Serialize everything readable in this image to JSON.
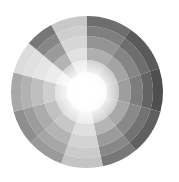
{
  "background_color": "#ffffff",
  "figure": {
    "title": "",
    "width": 179,
    "height": 182
  },
  "chart_data": {
    "type": "pie",
    "subtype": "polar-area-sunburst",
    "title": "",
    "subtitle": "",
    "xlabel": "",
    "ylabel": "",
    "grid": false,
    "axes_visible": false,
    "tick_labels_visible": false,
    "legend": false,
    "legend_position": "none",
    "background_color": "#ffffff",
    "center": {
      "x": 87,
      "y": 92
    },
    "outer_radius": 76,
    "inner_white_radius": 9,
    "ring_count": 6,
    "ring_radii": [
      9,
      20,
      32,
      44,
      56,
      66,
      76
    ],
    "ring_shading_note": "rings lighten progressively toward the center; innermost core is near-white",
    "ring_lightness_factors": [
      0.92,
      0.68,
      0.45,
      0.26,
      0.12,
      0.0
    ],
    "sector_count": 12,
    "angle_unit": "degrees-clockwise-from-12-oclock",
    "categories": [
      "S1",
      "S2",
      "S3",
      "S4",
      "S5",
      "S6",
      "S7",
      "S8",
      "S9",
      "S10",
      "S11",
      "S12"
    ],
    "sectors": [
      {
        "label": "S1",
        "start_angle": 0,
        "end_angle": 35,
        "color": "#6e6e6e",
        "value": 76
      },
      {
        "label": "S2",
        "start_angle": 35,
        "end_angle": 72,
        "color": "#5a5a5a",
        "value": 76
      },
      {
        "label": "S3",
        "start_angle": 72,
        "end_angle": 105,
        "color": "#4f4f4f",
        "value": 76
      },
      {
        "label": "S4",
        "start_angle": 105,
        "end_angle": 140,
        "color": "#606060",
        "value": 76
      },
      {
        "label": "S5",
        "start_angle": 140,
        "end_angle": 168,
        "color": "#787878",
        "value": 76
      },
      {
        "label": "S6",
        "start_angle": 168,
        "end_angle": 200,
        "color": "#c4c4c4",
        "value": 76
      },
      {
        "label": "S7",
        "start_angle": 200,
        "end_angle": 228,
        "color": "#9a9a9a",
        "value": 76
      },
      {
        "label": "S8",
        "start_angle": 228,
        "end_angle": 255,
        "color": "#8e8e8e",
        "value": 76
      },
      {
        "label": "S9",
        "start_angle": 255,
        "end_angle": 285,
        "color": "#a8a8a8",
        "value": 76
      },
      {
        "label": "S10",
        "start_angle": 285,
        "end_angle": 310,
        "color": "#dcdcdc",
        "value": 76
      },
      {
        "label": "S11",
        "start_angle": 310,
        "end_angle": 332,
        "color": "#777777",
        "value": 76
      },
      {
        "label": "S12",
        "start_angle": 332,
        "end_angle": 360,
        "color": "#c8c8c8",
        "value": 76
      }
    ],
    "values": [
      76,
      76,
      76,
      76,
      76,
      76,
      76,
      76,
      76,
      76,
      76,
      76
    ],
    "colors": [
      "#6e6e6e",
      "#5a5a5a",
      "#4f4f4f",
      "#606060",
      "#787878",
      "#c4c4c4",
      "#9a9a9a",
      "#8e8e8e",
      "#a8a8a8",
      "#dcdcdc",
      "#777777",
      "#c8c8c8"
    ],
    "annotations": []
  }
}
